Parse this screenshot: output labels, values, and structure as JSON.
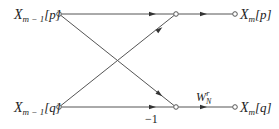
{
  "diagram": {
    "type": "butterfly",
    "inputs": {
      "top": {
        "base": "X",
        "sub": "m − 1",
        "arg": "[p]"
      },
      "bottom": {
        "base": "X",
        "sub": "m − 1",
        "arg": "[q]"
      }
    },
    "outputs": {
      "top": {
        "base": "X",
        "sub": "m",
        "arg": "[p]"
      },
      "bottom": {
        "base": "X",
        "sub": "m",
        "arg": "[q]"
      }
    },
    "weights": {
      "twiddle": {
        "base": "W",
        "sub": "N",
        "sup": "r"
      },
      "negation": "−1"
    },
    "edges": [
      {
        "from": "in_top",
        "to": "mid_top"
      },
      {
        "from": "in_top",
        "to": "mid_bottom"
      },
      {
        "from": "in_bottom",
        "to": "mid_top"
      },
      {
        "from": "in_bottom",
        "to": "mid_bottom",
        "label": "−1"
      },
      {
        "from": "mid_top",
        "to": "out_top"
      },
      {
        "from": "mid_bottom",
        "to": "out_bottom",
        "label": "W_N^r"
      }
    ]
  }
}
